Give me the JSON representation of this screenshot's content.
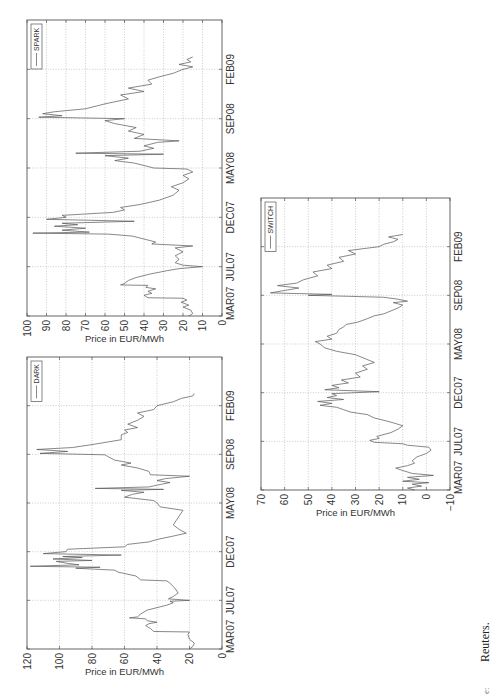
{
  "caption": {
    "partial": "e:",
    "text": "Reuters."
  },
  "chart_data": [
    {
      "type": "line",
      "name": "SPARK",
      "legend": [
        "SPARK"
      ],
      "legend_position": "top-right",
      "ylabel": "Price in EUR/MWh",
      "xlabel": "",
      "title": "",
      "grid": true,
      "xticks": [
        0,
        1,
        2,
        3,
        4,
        5
      ],
      "xtick_labels": [
        "MAR07",
        "JUL07",
        "DEC07",
        "MAY08",
        "SEP08",
        "FEB09"
      ],
      "xlim": [
        0,
        6
      ],
      "ylim": [
        0,
        100
      ],
      "yticks": [
        0,
        10,
        20,
        30,
        40,
        50,
        60,
        70,
        80,
        90,
        100
      ],
      "ytick_labels": [
        "0",
        "10",
        "20",
        "30",
        "40",
        "50",
        "60",
        "70",
        "80",
        "90",
        "100"
      ],
      "x_note": "x is position in tick-interval units (0 = MAR07, 5 = FEB09)",
      "x": [
        0.0,
        0.05,
        0.12,
        0.18,
        0.22,
        0.28,
        0.32,
        0.36,
        0.37,
        0.42,
        0.46,
        0.5,
        0.55,
        0.58,
        0.62,
        0.63,
        0.66,
        0.72,
        0.78,
        0.85,
        0.92,
        0.96,
        1.0,
        1.03,
        1.08,
        1.15,
        1.22,
        1.3,
        1.38,
        1.42,
        1.46,
        1.5,
        1.58,
        1.62,
        1.66,
        1.68,
        1.7,
        1.74,
        1.78,
        1.82,
        1.85,
        1.88,
        1.92,
        1.96,
        2.0,
        2.04,
        2.1,
        2.15,
        2.2,
        2.26,
        2.35,
        2.45,
        2.55,
        2.62,
        2.7,
        2.78,
        2.85,
        2.92,
        2.98,
        3.0,
        3.05,
        3.1,
        3.15,
        3.2,
        3.25,
        3.28,
        3.3,
        3.34,
        3.4,
        3.45,
        3.52,
        3.55,
        3.6,
        3.68,
        3.75,
        3.82,
        3.9,
        3.96,
        4.0,
        4.03,
        4.06,
        4.1,
        4.14,
        4.2,
        4.3,
        4.4,
        4.48,
        4.55,
        4.62,
        4.7,
        4.78,
        4.85,
        4.92,
        5.0,
        5.05,
        5.1,
        5.15,
        5.2,
        5.25
      ],
      "values": [
        17,
        15,
        16,
        20,
        17,
        21,
        18,
        20,
        38,
        40,
        36,
        38,
        34,
        39,
        38,
        52,
        50,
        48,
        44,
        37,
        28,
        22,
        10,
        20,
        24,
        22,
        24,
        20,
        24,
        15,
        36,
        34,
        42,
        46,
        58,
        97,
        68,
        82,
        70,
        86,
        74,
        82,
        45,
        90,
        80,
        82,
        56,
        50,
        52,
        42,
        32,
        25,
        22,
        26,
        20,
        17,
        20,
        15,
        18,
        35,
        40,
        45,
        55,
        48,
        60,
        30,
        75,
        42,
        35,
        40,
        33,
        22,
        45,
        40,
        48,
        44,
        55,
        60,
        50,
        94,
        82,
        92,
        86,
        70,
        60,
        48,
        52,
        40,
        48,
        36,
        38,
        32,
        25,
        20,
        15,
        22,
        16,
        18,
        15
      ]
    },
    {
      "type": "line",
      "name": "DARK",
      "legend": [
        "DARK"
      ],
      "legend_position": "top-right",
      "ylabel": "Price in EUR/MWh",
      "xlabel": "",
      "title": "",
      "grid": true,
      "xticks": [
        0,
        1,
        2,
        3,
        4,
        5
      ],
      "xtick_labels": [
        "MAR07",
        "JUL07",
        "DEC07",
        "MAY08",
        "SEP08",
        "FEB09"
      ],
      "xlim": [
        0,
        6
      ],
      "ylim": [
        0,
        120
      ],
      "yticks": [
        0,
        20,
        40,
        60,
        80,
        100,
        120
      ],
      "ytick_labels": [
        "0",
        "20",
        "40",
        "60",
        "80",
        "100",
        "120"
      ],
      "x_note": "x is position in tick-interval units (0 = MAR07, 5 = FEB09)",
      "x": [
        0.0,
        0.05,
        0.12,
        0.2,
        0.3,
        0.35,
        0.36,
        0.42,
        0.48,
        0.52,
        0.55,
        0.58,
        0.62,
        0.64,
        0.66,
        0.72,
        0.8,
        0.85,
        0.9,
        0.95,
        0.98,
        1.0,
        1.03,
        1.08,
        1.15,
        1.25,
        1.35,
        1.4,
        1.42,
        1.5,
        1.58,
        1.62,
        1.66,
        1.68,
        1.7,
        1.73,
        1.76,
        1.8,
        1.82,
        1.85,
        1.88,
        1.9,
        1.93,
        1.96,
        2.0,
        2.05,
        2.1,
        2.15,
        2.2,
        2.25,
        2.32,
        2.38,
        2.45,
        2.55,
        2.65,
        2.75,
        2.85,
        2.92,
        3.0,
        3.05,
        3.12,
        3.18,
        3.22,
        3.26,
        3.28,
        3.3,
        3.33,
        3.38,
        3.42,
        3.46,
        3.5,
        3.55,
        3.58,
        3.65,
        3.72,
        3.78,
        3.82,
        3.88,
        3.95,
        3.99,
        4.02,
        4.06,
        4.1,
        4.14,
        4.2,
        4.3,
        4.4,
        4.45,
        4.5,
        4.55,
        4.62,
        4.7,
        4.78,
        4.85,
        4.92,
        5.0,
        5.08,
        5.15,
        5.2,
        5.25
      ],
      "values": [
        20,
        18,
        17,
        20,
        21,
        20,
        42,
        44,
        47,
        45,
        40,
        46,
        47,
        57,
        52,
        50,
        46,
        40,
        34,
        30,
        32,
        20,
        33,
        30,
        27,
        29,
        32,
        34,
        50,
        53,
        64,
        66,
        90,
        75,
        118,
        88,
        95,
        102,
        80,
        104,
        86,
        98,
        62,
        110,
        96,
        95,
        60,
        58,
        45,
        40,
        30,
        22,
        26,
        30,
        28,
        26,
        24,
        38,
        40,
        42,
        60,
        55,
        48,
        62,
        36,
        78,
        45,
        38,
        32,
        40,
        35,
        20,
        44,
        45,
        52,
        62,
        56,
        66,
        70,
        72,
        112,
        95,
        114,
        92,
        80,
        62,
        62,
        58,
        60,
        52,
        58,
        52,
        48,
        52,
        42,
        40,
        30,
        25,
        18,
        17
      ]
    },
    {
      "type": "line",
      "name": "SWITCH",
      "legend": [
        "SWITCH"
      ],
      "legend_position": "top-right",
      "ylabel": "Price in EUR/MWh",
      "xlabel": "",
      "title": "",
      "grid": true,
      "xticks": [
        0,
        1,
        2,
        3,
        4,
        5
      ],
      "xtick_labels": [
        "MAR07",
        "JUL07",
        "DEC07",
        "MAY08",
        "SEP08",
        "FEB09"
      ],
      "xlim": [
        0,
        6
      ],
      "ylim": [
        -10,
        70
      ],
      "yticks": [
        -10,
        0,
        10,
        20,
        30,
        40,
        50,
        60,
        70
      ],
      "ytick_labels": [
        "−10",
        "0",
        "10",
        "20",
        "30",
        "40",
        "50",
        "60",
        "70"
      ],
      "x_note": "x is position in tick-interval units (0 = MAR07, 5 = FEB09)",
      "x": [
        0.0,
        0.04,
        0.08,
        0.12,
        0.15,
        0.18,
        0.22,
        0.26,
        0.3,
        0.34,
        0.4,
        0.45,
        0.5,
        0.55,
        0.6,
        0.68,
        0.75,
        0.82,
        0.88,
        0.92,
        0.95,
        0.98,
        1.02,
        1.06,
        1.1,
        1.18,
        1.25,
        1.32,
        1.38,
        1.42,
        1.48,
        1.55,
        1.6,
        1.65,
        1.7,
        1.74,
        1.78,
        1.82,
        1.86,
        1.9,
        1.94,
        1.98,
        2.02,
        2.06,
        2.1,
        2.15,
        2.2,
        2.26,
        2.32,
        2.4,
        2.48,
        2.55,
        2.62,
        2.7,
        2.78,
        2.85,
        2.92,
        3.0,
        3.05,
        3.1,
        3.16,
        3.22,
        3.3,
        3.35,
        3.4,
        3.45,
        3.52,
        3.58,
        3.62,
        3.68,
        3.74,
        3.8,
        3.85,
        3.88,
        3.92,
        3.96,
        3.98,
        4.0,
        4.02,
        4.05,
        4.1,
        4.15,
        4.2,
        4.25,
        4.32,
        4.4,
        4.48,
        4.55,
        4.62,
        4.7,
        4.78,
        4.85,
        4.92,
        5.0,
        5.05,
        5.1,
        5.15,
        5.2,
        5.25
      ],
      "values": [
        5,
        8,
        2,
        6,
        -1,
        10,
        3,
        8,
        -3,
        6,
        10,
        13,
        8,
        5,
        6,
        4,
        0,
        -2,
        -1,
        8,
        10,
        22,
        24,
        20,
        21,
        15,
        12,
        10,
        14,
        17,
        22,
        25,
        32,
        35,
        38,
        45,
        40,
        46,
        35,
        42,
        38,
        40,
        20,
        43,
        37,
        40,
        33,
        36,
        28,
        30,
        25,
        27,
        22,
        26,
        30,
        38,
        43,
        45,
        47,
        40,
        42,
        38,
        37,
        35,
        34,
        29,
        25,
        22,
        18,
        15,
        12,
        10,
        14,
        8,
        12,
        18,
        33,
        50,
        40,
        66,
        60,
        54,
        63,
        55,
        52,
        46,
        48,
        40,
        42,
        35,
        37,
        30,
        33,
        20,
        18,
        14,
        12,
        16,
        10
      ]
    }
  ]
}
